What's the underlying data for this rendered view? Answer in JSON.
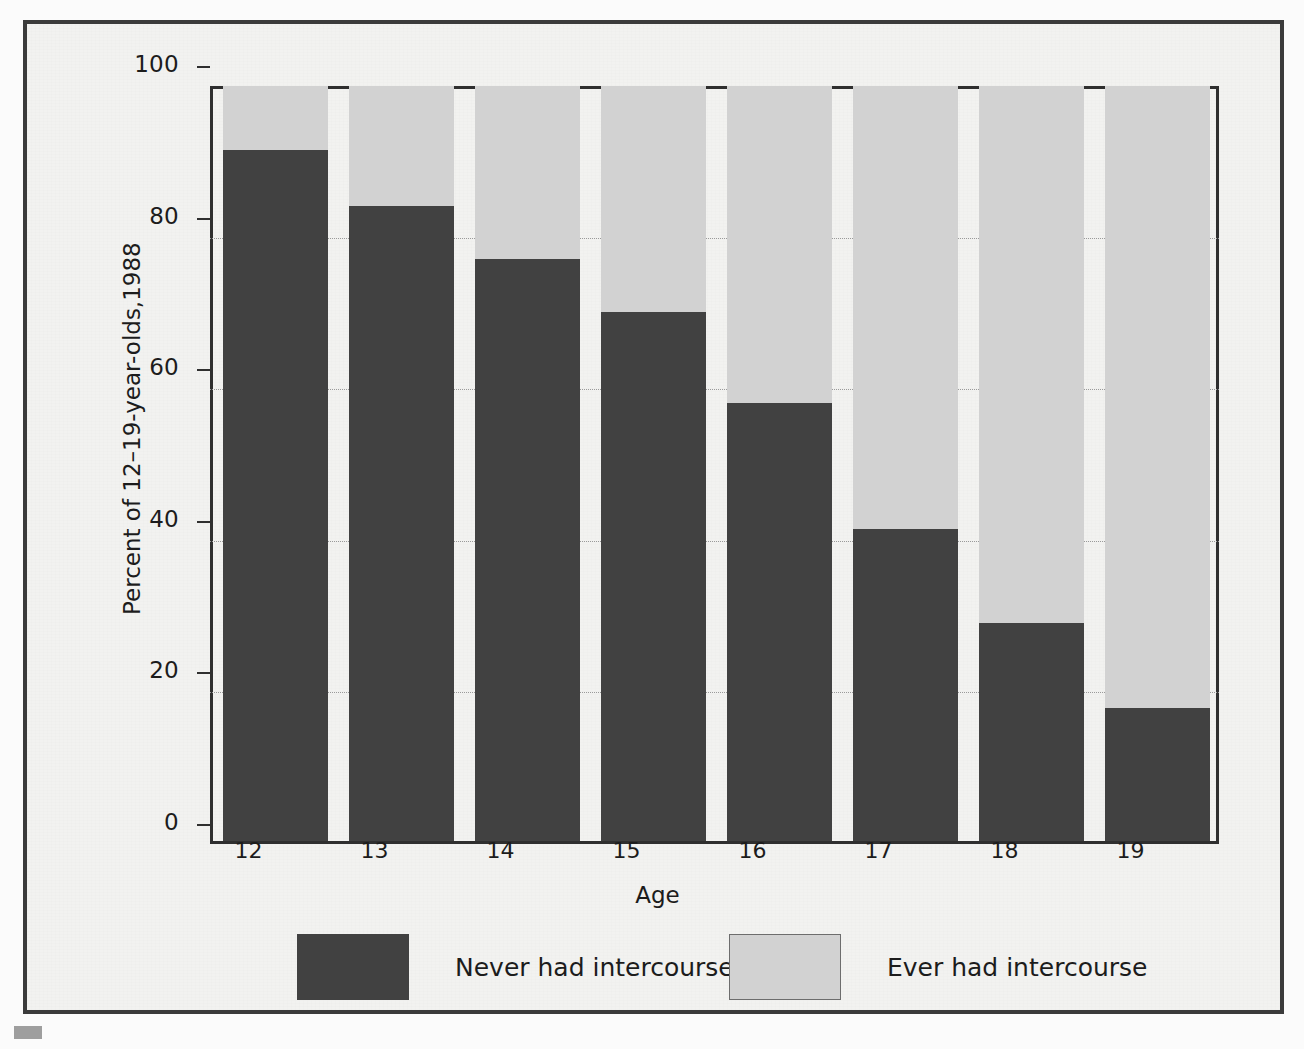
{
  "chart_data": {
    "type": "bar",
    "subtype": "stacked-100-percent",
    "title": "",
    "xlabel": "Age",
    "ylabel": "Percent of 12–19-year-olds,1988",
    "categories": [
      "12",
      "13",
      "14",
      "15",
      "16",
      "17",
      "18",
      "19"
    ],
    "ylim": [
      0,
      100
    ],
    "yticks": [
      0,
      20,
      40,
      60,
      80,
      100
    ],
    "ytick_labels": [
      "0",
      "20",
      "40",
      "60",
      "80",
      "100"
    ],
    "grid": "horizontal-dotted",
    "legend_position": "below-plot",
    "series": [
      {
        "name": "Never had intercourse",
        "color": "#414141",
        "values": [
          91.5,
          84.2,
          77.2,
          70.2,
          58.2,
          41.5,
          29.2,
          18.0
        ]
      },
      {
        "name": "Ever had intercourse",
        "color": "#d2d2d2",
        "values": [
          8.5,
          15.8,
          22.8,
          29.8,
          41.8,
          58.5,
          70.8,
          82.0
        ]
      }
    ]
  },
  "axes": {
    "y_title": "Percent of 12–19-year-olds,1988",
    "x_title": "Age",
    "y_tick_labels": [
      "100",
      "80",
      "60",
      "40",
      "20",
      "0"
    ],
    "x_tick_labels": [
      "12",
      "13",
      "14",
      "15",
      "16",
      "17",
      "18",
      "19"
    ]
  },
  "legend": {
    "entries": [
      {
        "label": "Never had intercourse",
        "swatch": "dark"
      },
      {
        "label": "Ever had intercourse",
        "swatch": "light"
      }
    ]
  },
  "colors": {
    "never": "#414141",
    "ever": "#d2d2d2",
    "frame": "#3b3b3b",
    "paper": "#f2f2f0",
    "axis": "#2f2f2f",
    "grid": "#9a9a9a"
  }
}
